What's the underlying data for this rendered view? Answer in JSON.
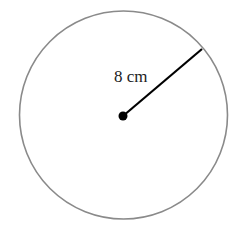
{
  "diagram": {
    "type": "circle-with-radius",
    "radius_label": "8 cm",
    "colors": {
      "circle_stroke": "#8a8a8a",
      "radius_line": "#000000",
      "center_dot": "#000000",
      "background": "#ffffff"
    }
  }
}
